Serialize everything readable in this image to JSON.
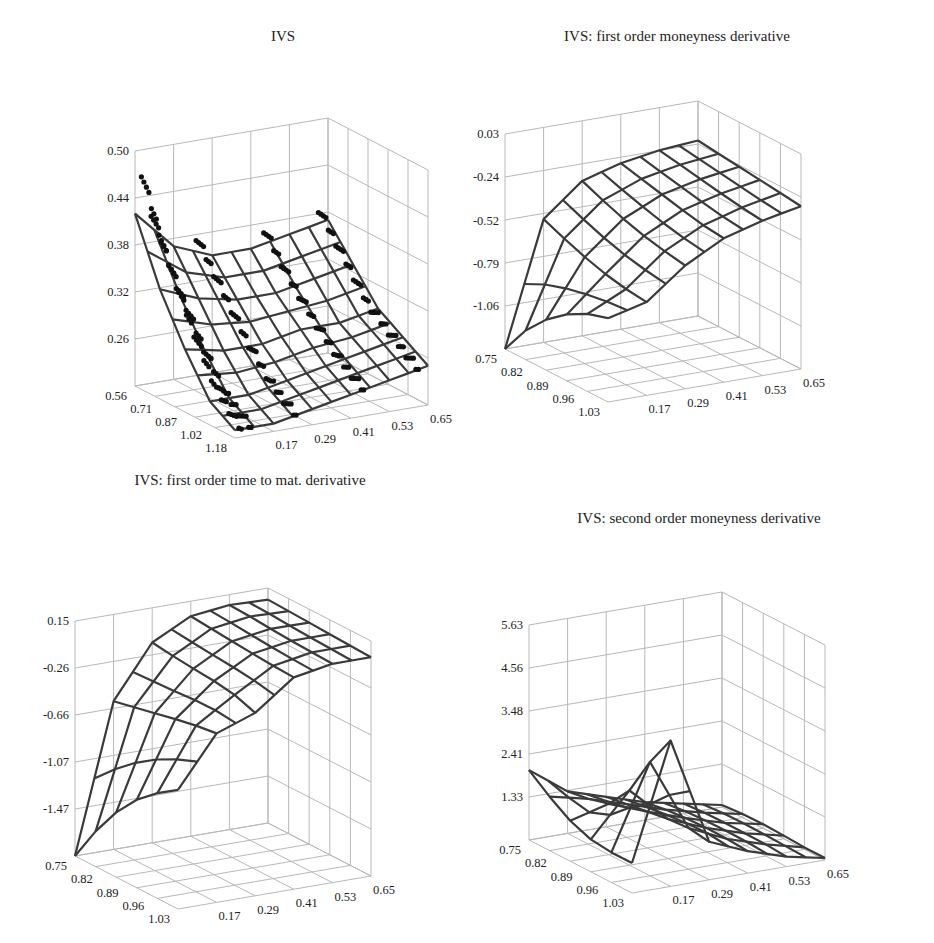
{
  "chart_data": [
    {
      "type": "surface3d",
      "title": "IVS",
      "xlabel": "",
      "ylabel": "",
      "zlabel": "",
      "x_axis": {
        "name": "moneyness",
        "ticks": [
          "0.56",
          "0.71",
          "0.87",
          "1.02",
          "1.18"
        ],
        "range": [
          0.56,
          1.18
        ]
      },
      "y_axis": {
        "name": "time to maturity",
        "ticks": [
          "0.17",
          "0.29",
          "0.41",
          "0.53",
          "0.65"
        ],
        "range": [
          0.05,
          0.65
        ]
      },
      "z_axis": {
        "ticks": [
          "0.26",
          "0.32",
          "0.38",
          "0.44",
          "0.50"
        ],
        "range": [
          0.2,
          0.5
        ]
      },
      "grid": true,
      "has_scatter_points": true,
      "description": "Smoothed implied volatility surface (mesh) over observed implied volatility data points (black dots); smile decreasing in moneyness, steeper for short maturities",
      "surface_samples": {
        "moneyness": [
          0.56,
          0.71,
          0.87,
          1.02,
          1.18
        ],
        "maturity": [
          0.05,
          0.17,
          0.29,
          0.41,
          0.53,
          0.65
        ],
        "z": [
          [
            0.42,
            0.37,
            0.35,
            0.35,
            0.36,
            0.37
          ],
          [
            0.34,
            0.32,
            0.31,
            0.31,
            0.32,
            0.33
          ],
          [
            0.28,
            0.27,
            0.27,
            0.28,
            0.28,
            0.29
          ],
          [
            0.23,
            0.23,
            0.24,
            0.25,
            0.26,
            0.27
          ],
          [
            0.21,
            0.21,
            0.22,
            0.23,
            0.24,
            0.25
          ]
        ]
      }
    },
    {
      "type": "surface3d",
      "title": "IVS: first order moneyness derivative",
      "x_axis": {
        "name": "moneyness",
        "ticks": [
          "0.75",
          "0.82",
          "0.89",
          "0.96",
          "1.03"
        ],
        "range": [
          0.75,
          1.03
        ]
      },
      "y_axis": {
        "name": "time to maturity",
        "ticks": [
          "0.17",
          "0.29",
          "0.41",
          "0.53",
          "0.65"
        ],
        "range": [
          0.05,
          0.65
        ]
      },
      "z_axis": {
        "ticks": [
          "-1.06",
          "-0.79",
          "-0.52",
          "-0.24",
          "0.03"
        ],
        "range": [
          -1.33,
          0.03
        ]
      },
      "grid": true,
      "description": "Derivative strongly negative (~-1.33) at short maturity / low moneyness, flattening toward ~-0.2 for long maturities",
      "surface_samples": {
        "moneyness": [
          0.75,
          0.82,
          0.89,
          0.96,
          1.03
        ],
        "maturity": [
          0.05,
          0.17,
          0.29,
          0.41,
          0.53,
          0.65
        ],
        "z": [
          [
            -1.33,
            -0.55,
            -0.35,
            -0.28,
            -0.24,
            -0.22
          ],
          [
            -1.1,
            -0.62,
            -0.42,
            -0.32,
            -0.27,
            -0.24
          ],
          [
            -0.95,
            -0.68,
            -0.48,
            -0.36,
            -0.3,
            -0.26
          ],
          [
            -0.85,
            -0.72,
            -0.52,
            -0.4,
            -0.33,
            -0.28
          ],
          [
            -0.8,
            -0.74,
            -0.55,
            -0.42,
            -0.35,
            -0.3
          ]
        ]
      }
    },
    {
      "type": "surface3d",
      "title": "IVS: first order time to mat. derivative",
      "x_axis": {
        "name": "moneyness",
        "ticks": [
          "0.75",
          "0.82",
          "0.89",
          "0.96",
          "1.03"
        ],
        "range": [
          0.75,
          1.03
        ]
      },
      "y_axis": {
        "name": "time to maturity",
        "ticks": [
          "0.17",
          "0.29",
          "0.41",
          "0.53",
          "0.65"
        ],
        "range": [
          0.05,
          0.65
        ]
      },
      "z_axis": {
        "ticks": [
          "-1.47",
          "-1.07",
          "-0.66",
          "-0.26",
          "0.15"
        ],
        "range": [
          -1.88,
          0.15
        ]
      },
      "grid": true,
      "description": "Derivative very negative (~-1.88) at shortest maturity / lowest moneyness, rising to about 0 to 0.1 elsewhere",
      "surface_samples": {
        "moneyness": [
          0.75,
          0.82,
          0.89,
          0.96,
          1.03
        ],
        "maturity": [
          0.05,
          0.17,
          0.29,
          0.41,
          0.53,
          0.65
        ],
        "z": [
          [
            -1.88,
            -0.6,
            -0.15,
            0.02,
            0.06,
            0.05
          ],
          [
            -1.5,
            -0.55,
            -0.18,
            0.0,
            0.05,
            0.04
          ],
          [
            -1.2,
            -0.5,
            -0.2,
            -0.02,
            0.03,
            0.03
          ],
          [
            -1.0,
            -0.45,
            -0.22,
            -0.04,
            0.02,
            0.02
          ],
          [
            -0.85,
            -0.42,
            -0.3,
            -0.05,
            0.01,
            0.01
          ]
        ]
      }
    },
    {
      "type": "surface3d",
      "title": "IVS: second order moneyness derivative",
      "x_axis": {
        "name": "moneyness",
        "ticks": [
          "0.75",
          "0.82",
          "0.89",
          "0.96",
          "1.03"
        ],
        "range": [
          0.75,
          1.03
        ]
      },
      "y_axis": {
        "name": "time to maturity",
        "ticks": [
          "0.17",
          "0.29",
          "0.41",
          "0.53",
          "0.65"
        ],
        "range": [
          0.05,
          0.65
        ]
      },
      "z_axis": {
        "ticks": [
          "1.33",
          "2.41",
          "3.48",
          "4.56",
          "5.63"
        ],
        "range": [
          0.25,
          5.63
        ]
      },
      "grid": true,
      "description": "Convexity ~2 at short maturity with a peak (~3.9) at high moneyness / short maturity, decaying toward ~0.3 at long maturities",
      "surface_samples": {
        "moneyness": [
          0.75,
          0.82,
          0.89,
          0.96,
          1.03
        ],
        "maturity": [
          0.05,
          0.17,
          0.29,
          0.41,
          0.53,
          0.65
        ],
        "z": [
          [
            2.0,
            1.3,
            1.0,
            0.7,
            0.5,
            0.3
          ],
          [
            1.5,
            1.4,
            1.1,
            0.8,
            0.55,
            0.35
          ],
          [
            1.1,
            1.6,
            1.2,
            0.85,
            0.55,
            0.35
          ],
          [
            1.0,
            2.9,
            1.3,
            0.85,
            0.55,
            0.3
          ],
          [
            1.0,
            3.9,
            1.2,
            0.8,
            0.5,
            0.3
          ]
        ]
      }
    }
  ],
  "panels": [
    {
      "title": "IVS"
    },
    {
      "title": "IVS: first order moneyness derivative"
    },
    {
      "title": "IVS: first order time to mat. derivative"
    },
    {
      "title": "IVS: second order moneyness derivative"
    }
  ]
}
